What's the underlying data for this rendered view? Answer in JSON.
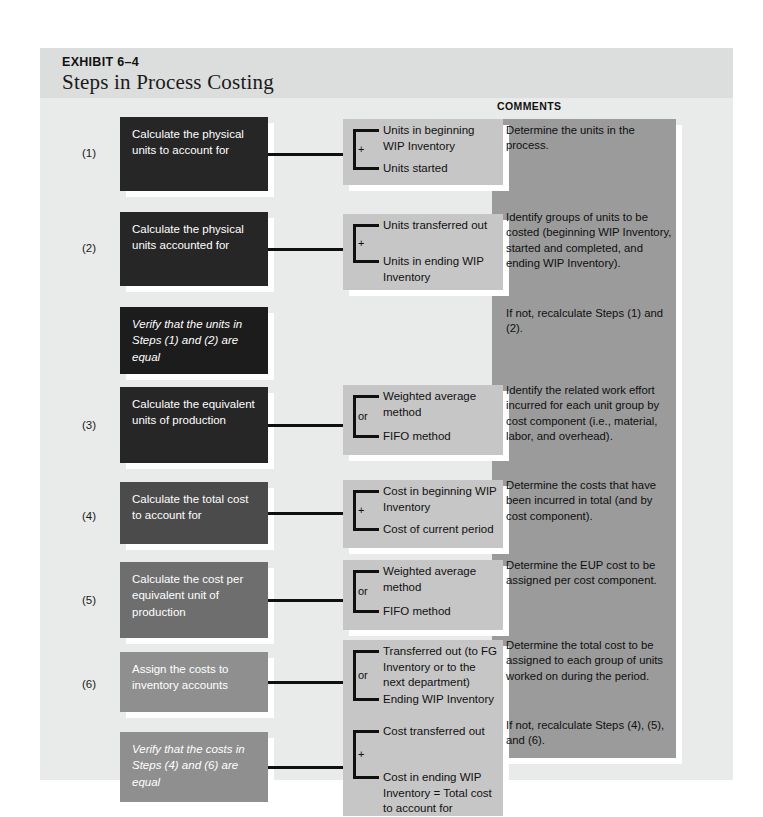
{
  "exhibit": {
    "label": "EXHIBIT 6–4",
    "title": "Steps in Process Costing",
    "comments_header": "COMMENTS"
  },
  "rows": [
    {
      "number": "(1)",
      "step": "Calculate the physical units to account for",
      "italic": false,
      "box_color": "#262626",
      "operator": "+",
      "details": [
        "Units in beginning WIP Inventory",
        "Units started"
      ],
      "comment": "Determine the units in the process."
    },
    {
      "number": "(2)",
      "step": "Calculate the physical units accounted for",
      "italic": false,
      "box_color": "#262626",
      "operator": "+",
      "details": [
        "Units transferred out",
        "Units in ending WIP Inventory"
      ],
      "comment": "Identify groups of units to be costed (beginning WIP Inventory, started and completed, and ending WIP Inventory)."
    },
    {
      "number": "",
      "step": "Verify that the units in Steps (1) and (2) are equal",
      "italic": true,
      "box_color": "#1c1c1c",
      "operator": "",
      "details": [],
      "comment": "If not, recalculate Steps (1) and (2)."
    },
    {
      "number": "(3)",
      "step": "Calculate the equivalent units of production",
      "italic": false,
      "box_color": "#262626",
      "operator": "or",
      "details": [
        "Weighted average method",
        "FIFO method"
      ],
      "comment": "Identify the related work effort incurred for each unit group by cost component (i.e., material, labor, and overhead)."
    },
    {
      "number": "(4)",
      "step": "Calculate the total cost to account for",
      "italic": false,
      "box_color": "#4b4b4b",
      "operator": "+",
      "details": [
        "Cost in beginning WIP Inventory",
        "Cost of current period"
      ],
      "comment": "Determine the costs that have been incurred in total (and by cost component)."
    },
    {
      "number": "(5)",
      "step": "Calculate the cost per equivalent unit of production",
      "italic": false,
      "box_color": "#6e6e6e",
      "operator": "or",
      "details": [
        "Weighted average method",
        "FIFO method"
      ],
      "comment": "Determine the EUP cost to be assigned per cost component."
    },
    {
      "number": "(6)",
      "step": "Assign the costs to inventory accounts",
      "italic": false,
      "box_color": "#8f8f8f",
      "operator": "or",
      "details": [
        "Transferred out (to FG Inventory or to the next department)",
        "Ending WIP Inventory"
      ],
      "comment": "Determine the total cost to be assigned to each group of units worked on during the period."
    },
    {
      "number": "",
      "step": "Verify that the costs in Steps (4) and (6) are equal",
      "italic": true,
      "box_color": "#8f8f8f",
      "operator": "+",
      "details": [
        "Cost transferred out",
        "Cost in ending WIP Inventory = Total cost to account for"
      ],
      "comment": "If not, recalculate Steps (4), (5), and (6)."
    }
  ],
  "colors": {
    "page_background": "#ffffff",
    "panel_background": "#e9eaea",
    "header_band": "#dcdddd",
    "detail_box": "#c6c6c6",
    "comments_panel": "#9b9b9b",
    "line": "#101010"
  }
}
